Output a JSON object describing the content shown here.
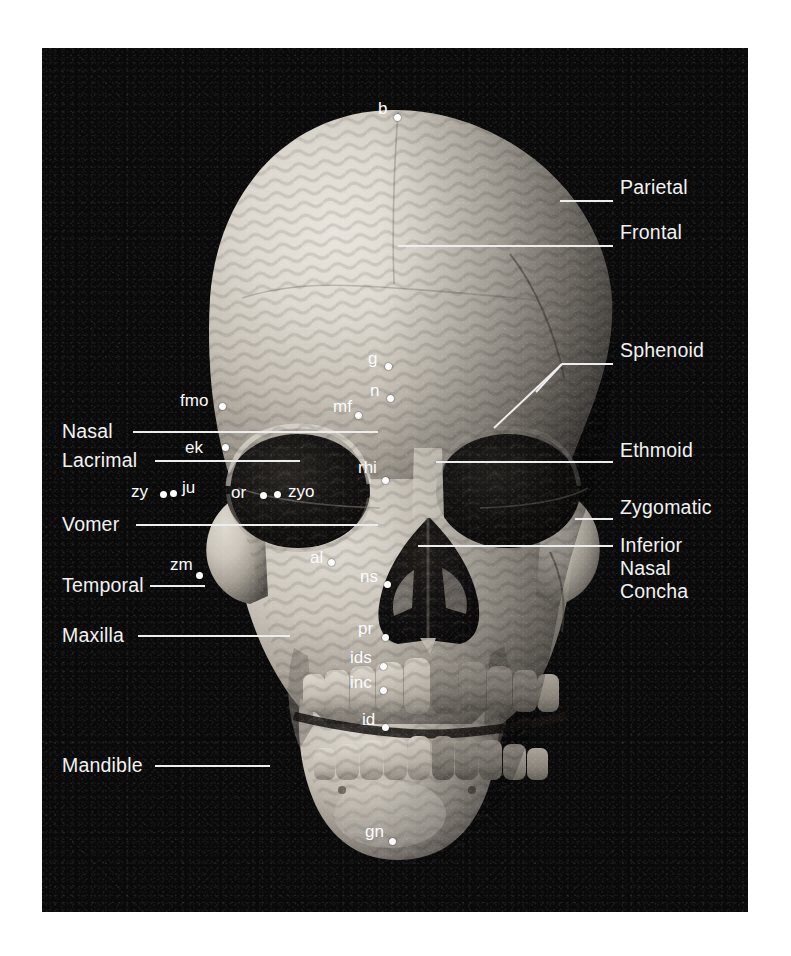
{
  "figure": {
    "plate_background": "#0a0a0a",
    "label_color": "#f2f2f2",
    "leader_color": "#ededed",
    "point_color": "#ffffff"
  },
  "bone_callouts_right": [
    {
      "id": "parietal",
      "label": "Parietal",
      "x": 620,
      "y": 186,
      "leader": {
        "x1": 560,
        "y1": 201,
        "x2": 613,
        "y2": 201
      }
    },
    {
      "id": "frontal",
      "label": "Frontal",
      "x": 620,
      "y": 231,
      "leader": {
        "x1": 398,
        "y1": 246,
        "x2": 613,
        "y2": 246
      }
    },
    {
      "id": "sphenoid",
      "label": "Sphenoid",
      "x": 620,
      "y": 349,
      "leader": {
        "x1": 562,
        "y1": 364,
        "x2": 613,
        "y2": 364
      },
      "fork": true
    },
    {
      "id": "ethmoid",
      "label": "Ethmoid",
      "x": 620,
      "y": 449,
      "leader": {
        "x1": 436,
        "y1": 462,
        "x2": 613,
        "y2": 462
      }
    },
    {
      "id": "zygomatic",
      "label": "Zygomatic",
      "x": 620,
      "y": 504,
      "leader": {
        "x1": 575,
        "y1": 519,
        "x2": 613,
        "y2": 519
      }
    },
    {
      "id": "inferior-nasal-concha",
      "label": "Inferior\nNasal\nConcha",
      "x": 620,
      "y": 538,
      "leader": {
        "x1": 418,
        "y1": 546,
        "x2": 613,
        "y2": 546
      }
    }
  ],
  "bone_callouts_left": [
    {
      "id": "nasal",
      "label": "Nasal",
      "x": 62,
      "y": 418,
      "leader": {
        "x1": 133,
        "y1": 432,
        "x2": 378,
        "y2": 432
      }
    },
    {
      "id": "lacrimal",
      "label": "Lacrimal",
      "x": 62,
      "y": 446,
      "leader": {
        "x1": 155,
        "y1": 461,
        "x2": 300,
        "y2": 461
      }
    },
    {
      "id": "vomer",
      "label": "Vomer",
      "x": 62,
      "y": 511,
      "leader": {
        "x1": 136,
        "y1": 525,
        "x2": 378,
        "y2": 525
      }
    },
    {
      "id": "temporal",
      "label": "Temporal",
      "x": 62,
      "y": 572,
      "leader": {
        "x1": 150,
        "y1": 586,
        "x2": 205,
        "y2": 586
      }
    },
    {
      "id": "maxilla",
      "label": "Maxilla",
      "x": 62,
      "y": 622,
      "leader": {
        "x1": 138,
        "y1": 636,
        "x2": 290,
        "y2": 636
      }
    },
    {
      "id": "mandible",
      "label": "Mandible",
      "x": 62,
      "y": 752,
      "leader": {
        "x1": 155,
        "y1": 766,
        "x2": 270,
        "y2": 766
      }
    }
  ],
  "landmarks": [
    {
      "id": "b",
      "label": "b",
      "lx": 378,
      "ly": 100,
      "px": 397,
      "py": 117
    },
    {
      "id": "g",
      "label": "g",
      "lx": 368,
      "ly": 350,
      "px": 388,
      "py": 366
    },
    {
      "id": "n",
      "label": "n",
      "lx": 370,
      "ly": 382,
      "px": 390,
      "py": 398
    },
    {
      "id": "mf",
      "label": "mf",
      "lx": 333,
      "ly": 398,
      "px": 358,
      "py": 415
    },
    {
      "id": "fmo",
      "label": "fmo",
      "lx": 180,
      "ly": 392,
      "px": 222,
      "py": 406
    },
    {
      "id": "ek",
      "label": "ek",
      "lx": 185,
      "ly": 439,
      "px": 225,
      "py": 447
    },
    {
      "id": "rhi",
      "label": "rhi",
      "lx": 358,
      "ly": 459,
      "px": 385,
      "py": 480
    },
    {
      "id": "zy",
      "label": "zy",
      "lx": 131,
      "ly": 483,
      "px": 163,
      "py": 494
    },
    {
      "id": "ju",
      "label": "ju",
      "lx": 182,
      "ly": 479,
      "px": 173,
      "py": 493
    },
    {
      "id": "or",
      "label": "or",
      "lx": 231,
      "ly": 484,
      "px": 263,
      "py": 495
    },
    {
      "id": "zyo",
      "label": "zyo",
      "lx": 288,
      "ly": 483,
      "px": 277,
      "py": 494
    },
    {
      "id": "zm",
      "label": "zm",
      "lx": 170,
      "ly": 556,
      "px": 199,
      "py": 575
    },
    {
      "id": "al",
      "label": "al",
      "lx": 310,
      "ly": 549,
      "px": 331,
      "py": 562
    },
    {
      "id": "ns",
      "label": "ns",
      "lx": 360,
      "ly": 568,
      "px": 387,
      "py": 584
    },
    {
      "id": "pr",
      "label": "pr",
      "lx": 358,
      "ly": 620,
      "px": 385,
      "py": 637
    },
    {
      "id": "ids",
      "label": "ids",
      "lx": 350,
      "ly": 649,
      "px": 383,
      "py": 666
    },
    {
      "id": "inc",
      "label": "inc",
      "lx": 350,
      "ly": 674,
      "px": 383,
      "py": 690
    },
    {
      "id": "id",
      "label": "id",
      "lx": 362,
      "ly": 711,
      "px": 385,
      "py": 727
    },
    {
      "id": "gn",
      "label": "gn",
      "lx": 365,
      "ly": 823,
      "px": 392,
      "py": 841
    }
  ]
}
